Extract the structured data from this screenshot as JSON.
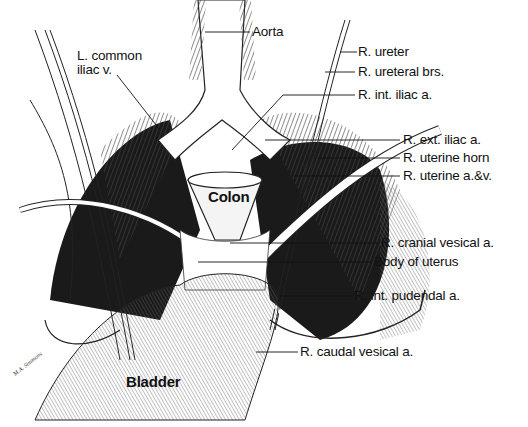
{
  "labels": {
    "aorta": "Aorta",
    "l_common_iliac_v_line1": "L. common",
    "l_common_iliac_v_line2": "iliac v.",
    "r_ureter": "R. ureter",
    "r_ureteral_brs": "R. ureteral brs.",
    "r_int_iliac_a": "R. int. iliac a.",
    "r_ext_iliac_a": "R. ext. iliac a.",
    "r_uterine_horn": "R. uterine horn",
    "r_uterine_a_v": "R. uterine a.&v.",
    "colon": "Colon",
    "r_cranial_vesical_a": "R. cranial vesical a.",
    "body_of_uterus": "Body of uterus",
    "r_int_pudendal_a": "R. int. pudendal a.",
    "r_caudal_vesical_a": "R. caudal vesical a.",
    "bladder": "Bladder"
  },
  "signature": "M.A. Simmons",
  "colors": {
    "ink": "#111111",
    "shade": "#2a2a2a",
    "paper": "#ffffff"
  }
}
